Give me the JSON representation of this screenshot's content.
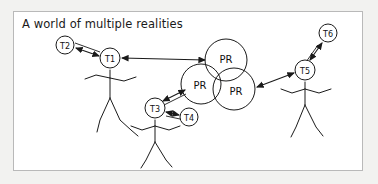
{
  "panel": {
    "title": "A world of multiple realities",
    "background_color": "#ffffff",
    "border_color": "#b9b9b9",
    "outer_background_color": "#f2f2f0",
    "stroke_color": "#1a1a1a"
  },
  "nodes": [
    {
      "id": "T2",
      "label": "T2",
      "cx": 65,
      "cy": 45,
      "r": 9
    },
    {
      "id": "T1",
      "label": "T1",
      "cx": 110,
      "cy": 58,
      "r": 10
    },
    {
      "id": "T3",
      "label": "T3",
      "cx": 155,
      "cy": 108,
      "r": 10
    },
    {
      "id": "T4",
      "label": "T4",
      "cx": 189,
      "cy": 117,
      "r": 9
    },
    {
      "id": "T5",
      "label": "T5",
      "cx": 305,
      "cy": 70,
      "r": 10
    },
    {
      "id": "T6",
      "label": "T6",
      "cx": 328,
      "cy": 33,
      "r": 9
    }
  ],
  "reality_circles": [
    {
      "id": "PR-top",
      "label": "PR",
      "cx": 226,
      "cy": 60,
      "r": 21
    },
    {
      "id": "PR-left",
      "label": "PR",
      "cx": 201,
      "cy": 84,
      "r": 20
    },
    {
      "id": "PR-right",
      "label": "PR",
      "cx": 234,
      "cy": 89,
      "r": 21
    }
  ],
  "figures": [
    {
      "id": "figure-left",
      "head_node": "T1",
      "neck_x": 110,
      "neck_y": 70
    },
    {
      "id": "figure-center",
      "head_node": "T3",
      "neck_x": 155,
      "neck_y": 120
    },
    {
      "id": "figure-right",
      "head_node": "T5",
      "neck_x": 305,
      "neck_y": 82
    }
  ],
  "connections": [
    {
      "id": "link-t2-t1",
      "from": "T2",
      "to": "T1",
      "style": "double-arrow"
    },
    {
      "id": "link-t1-pr",
      "from": "T1",
      "to": "PR-top",
      "style": "double-arrow"
    },
    {
      "id": "link-t3-pr",
      "from": "T3",
      "to": "PR-left",
      "style": "double-arrow"
    },
    {
      "id": "link-t3-t4",
      "from": "T3",
      "to": "T4",
      "style": "double-arrow"
    },
    {
      "id": "link-t5-pr",
      "from": "T5",
      "to": "PR-right",
      "style": "double-arrow"
    },
    {
      "id": "link-t5-t6",
      "from": "T5",
      "to": "T6",
      "style": "double-arrow"
    }
  ]
}
